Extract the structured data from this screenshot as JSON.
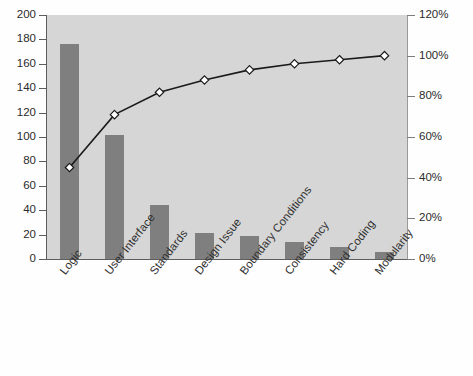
{
  "chart_data": {
    "type": "bar",
    "title": "",
    "subtitle": "",
    "xlabel": "",
    "ylabel": "",
    "y2label": "",
    "grid": false,
    "legend": "none",
    "categories": [
      "Logic",
      "User Interface",
      "Standards",
      "Design Issue",
      "Boundary Conditions",
      "Consistency",
      "Hard Coding",
      "Modularity"
    ],
    "values": [
      176,
      102,
      44,
      21,
      19,
      14,
      10,
      6
    ],
    "ylim": [
      0,
      200
    ],
    "y2lim": [
      0,
      120
    ],
    "yticks": [
      0,
      20,
      40,
      60,
      80,
      100,
      120,
      140,
      160,
      180,
      200
    ],
    "y2ticks": [
      "0%",
      "20%",
      "40%",
      "60%",
      "80%",
      "100%",
      "120%"
    ],
    "series": [
      {
        "name": "Count",
        "type": "bar",
        "axis": "left",
        "values": [
          176,
          102,
          44,
          21,
          19,
          14,
          10,
          6
        ]
      },
      {
        "name": "Cumulative %",
        "type": "line",
        "axis": "right",
        "values": [
          45,
          71,
          82,
          88,
          93,
          96,
          98,
          100
        ]
      }
    ],
    "cumulative_percent": [
      45,
      71,
      82,
      88,
      93,
      96,
      98,
      100
    ],
    "total": 392
  },
  "style": {
    "bar_color": "#7f7f7f",
    "plot_background": "#d6d6d6",
    "line_color": "#1a1a1a",
    "marker_fill": "#ffffff",
    "axis_color": "#5d5d5d",
    "text_color": "#2b2b2b"
  },
  "axis_left": {
    "labels": [
      "200",
      "180",
      "160",
      "140",
      "120",
      "100",
      "80",
      "60",
      "40",
      "20",
      "0"
    ]
  },
  "axis_right": {
    "labels": [
      "120%",
      "100%",
      "80%",
      "60%",
      "40%",
      "20%",
      "0%"
    ]
  }
}
